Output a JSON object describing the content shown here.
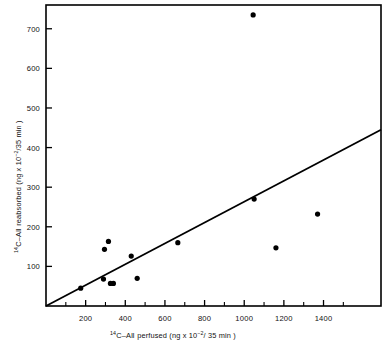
{
  "chart_data": {
    "type": "scatter",
    "title": "",
    "xlabel": "14C-A II perfused (ng x 10-2/35 min)",
    "ylabel": "14C-A II reabsorbed (ng x 10-2/35 min)",
    "xlim": [
      0,
      1690
    ],
    "ylim": [
      0,
      760
    ],
    "grid": false,
    "legend": null,
    "x_ticks": [
      200,
      400,
      600,
      800,
      1000,
      1200,
      1400
    ],
    "x_tick_labels": [
      "200",
      "400",
      "600",
      "800",
      "1000",
      "1200",
      "1400"
    ],
    "x_minor_ticks": [
      100,
      300,
      500,
      700,
      900,
      1100,
      1300,
      1500
    ],
    "y_ticks": [
      100,
      200,
      300,
      400,
      500,
      600,
      700
    ],
    "y_tick_labels": [
      "100",
      "200",
      "300",
      "400",
      "500",
      "600",
      "700"
    ],
    "points": [
      {
        "x": 175,
        "y": 45
      },
      {
        "x": 290,
        "y": 68
      },
      {
        "x": 295,
        "y": 143
      },
      {
        "x": 315,
        "y": 163
      },
      {
        "x": 325,
        "y": 57
      },
      {
        "x": 340,
        "y": 57
      },
      {
        "x": 430,
        "y": 126
      },
      {
        "x": 460,
        "y": 70
      },
      {
        "x": 665,
        "y": 160
      },
      {
        "x": 1045,
        "y": 735
      },
      {
        "x": 1050,
        "y": 270
      },
      {
        "x": 1160,
        "y": 147
      },
      {
        "x": 1370,
        "y": 232
      }
    ],
    "fit_line": {
      "x0": 0,
      "y0": 0,
      "x1": 1690,
      "y1": 445
    },
    "marker_color": "#000000",
    "line_color": "#000000",
    "frame_color": "#000000"
  },
  "axis_labels": {
    "x": {
      "isotope_sup": "14",
      "species": "C–A",
      "roman": "II",
      "verb": " perfused (ng x 10",
      "exp": "−2",
      "tail": "/ 35 min )"
    },
    "y": {
      "isotope_sup": "14",
      "species": "C–A",
      "roman": "II",
      "verb": " reabsorbed (ng x 10",
      "exp": "−2",
      "tail": "/35 min )"
    }
  }
}
